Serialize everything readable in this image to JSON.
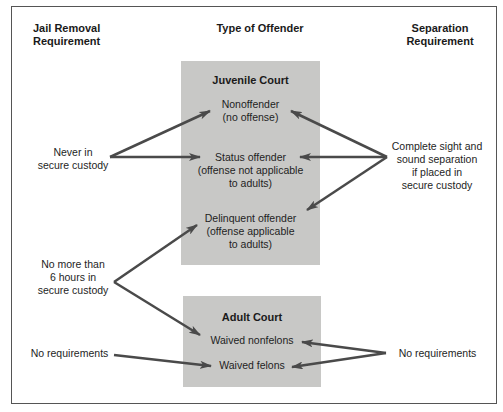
{
  "headers": {
    "jail_removal": [
      "Jail Removal",
      "Requirement"
    ],
    "type_of_offender": "Type of Offender",
    "separation": [
      "Separation",
      "Requirement"
    ]
  },
  "juvenile_court": {
    "title": "Juvenile Court",
    "nodes": [
      {
        "lines": [
          "Nonoffender",
          "(no offense)"
        ]
      },
      {
        "lines": [
          "Status offender",
          "(offense not applicable",
          "to adults)"
        ]
      },
      {
        "lines": [
          "Delinquent offender",
          "(offense applicable",
          "to adults)"
        ]
      }
    ]
  },
  "adult_court": {
    "title": "Adult Court",
    "nodes": [
      {
        "lines": [
          "Waived nonfelons"
        ]
      },
      {
        "lines": [
          "Waived felons"
        ]
      }
    ]
  },
  "jail_removal_labels": [
    {
      "lines": [
        "Never in",
        "secure custody"
      ],
      "targets": [
        "Nonoffender",
        "Status offender"
      ]
    },
    {
      "lines": [
        "No more than",
        "6 hours in",
        "secure custody"
      ],
      "targets": [
        "Delinquent offender",
        "Waived nonfelons"
      ]
    },
    {
      "lines": [
        "No requirements"
      ],
      "targets": [
        "Waived felons"
      ]
    }
  ],
  "separation_labels": [
    {
      "lines": [
        "Complete sight and",
        "sound separation",
        "if placed in",
        "secure custody"
      ],
      "targets": [
        "Nonoffender",
        "Status offender",
        "Delinquent offender"
      ]
    },
    {
      "lines": [
        "No requirements"
      ],
      "targets": [
        "Waived nonfelons",
        "Waived felons"
      ]
    }
  ],
  "colors": {
    "box_fill": "#c8c8c6",
    "arrow": "#4a4a4a",
    "frame": "#555555"
  }
}
